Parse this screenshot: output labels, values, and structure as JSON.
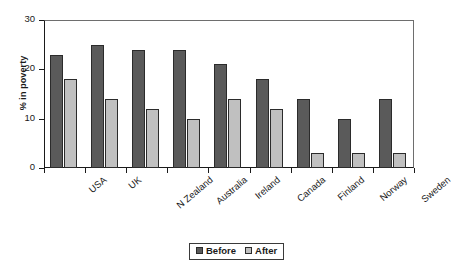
{
  "chart_data": {
    "type": "bar",
    "title": "",
    "xlabel": "",
    "ylabel": "% in poverty",
    "ylim": [
      0,
      30
    ],
    "yticks": [
      "0",
      "10",
      "20",
      "30"
    ],
    "grid": false,
    "legend_position": "bottom-center",
    "categories": [
      "USA",
      "UK",
      "N Zealand",
      "Australia",
      "Ireland",
      "Canada",
      "Finland",
      "Norway",
      "Sweden"
    ],
    "series": [
      {
        "name": "Before",
        "color": "#5a5a5a",
        "values": [
          23,
          25,
          24,
          24,
          21,
          18,
          14,
          10,
          14
        ]
      },
      {
        "name": "After",
        "color": "#c0c0c0",
        "values": [
          18,
          14,
          12,
          10,
          14,
          12,
          3,
          3,
          3
        ]
      }
    ]
  },
  "legend": {
    "items": [
      {
        "label": "Before"
      },
      {
        "label": "After"
      }
    ]
  }
}
